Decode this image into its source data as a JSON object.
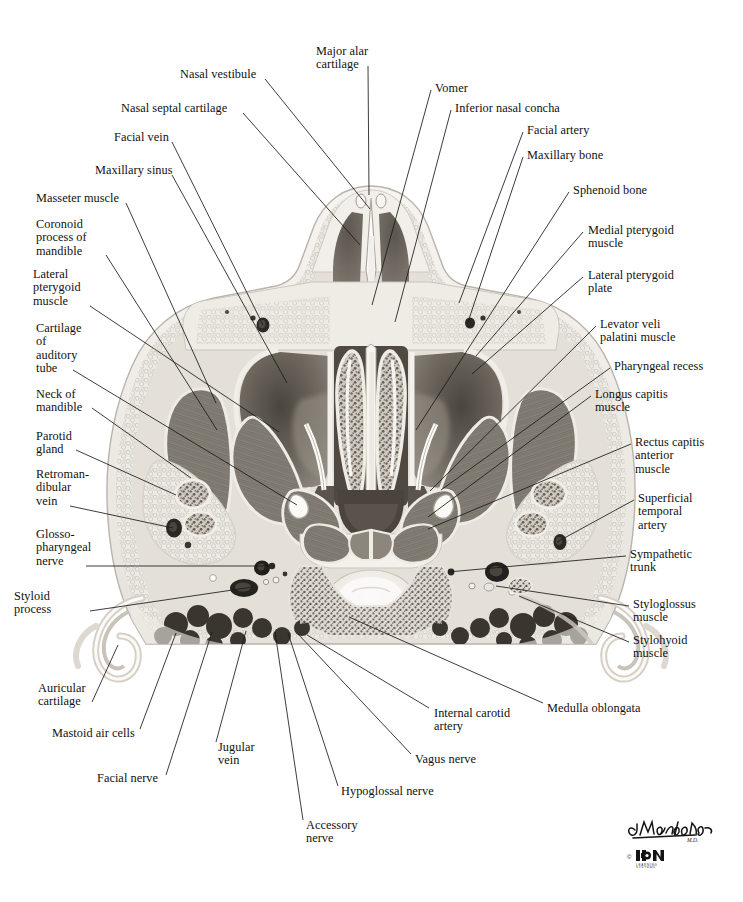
{
  "figure": {
    "type": "anatomical-illustration",
    "modality": "grayscale medical illustration",
    "credit_signature": "C. Machado",
    "credit_suffix": "M.D.",
    "copyright_symbol": "©",
    "publisher_logo_text": "ICON",
    "publisher_logo_sub": "LEARNING SYSTEMS"
  },
  "palette": {
    "background": "#ffffff",
    "line": "#1a1a1a",
    "text": "#111111",
    "tissue_light": "#efece6",
    "tissue_mid": "#c8c3ba",
    "muscle": "#8a857c",
    "muscle_dark": "#6b665e",
    "airspace": "#555049",
    "airspace_deep": "#3d3832",
    "bone_white": "#f7f5f1",
    "vessel_dark": "#2b2723",
    "mucosa": "#9a948a"
  },
  "labels_left": [
    {
      "id": "nasal-vestibule",
      "text": "Nasal vestibule",
      "x": 180,
      "y": 68,
      "anchor_x": 265,
      "anchor_y": 79,
      "target_x": 370,
      "target_y": 209
    },
    {
      "id": "nasal-septal-cartilage",
      "text": "Nasal septal cartilage",
      "x": 121,
      "y": 102,
      "anchor_x": 243,
      "anchor_y": 113,
      "target_x": 360,
      "target_y": 245
    },
    {
      "id": "facial-vein",
      "text": "Facial vein",
      "x": 114,
      "y": 131,
      "anchor_x": 172,
      "anchor_y": 142,
      "target_x": 263,
      "target_y": 325
    },
    {
      "id": "maxillary-sinus",
      "text": "Maxillary sinus",
      "x": 95,
      "y": 164,
      "anchor_x": 172,
      "anchor_y": 175,
      "target_x": 287,
      "target_y": 383
    },
    {
      "id": "masseter-muscle",
      "text": "Masseter muscle",
      "x": 36,
      "y": 192,
      "anchor_x": 126,
      "anchor_y": 203,
      "target_x": 216,
      "target_y": 403
    },
    {
      "id": "coronoid-process-of-mandible",
      "text": "Coronoid\nprocess of\nmandible",
      "x": 36,
      "y": 218,
      "anchor_x": 106,
      "anchor_y": 255,
      "target_x": 217,
      "target_y": 430
    },
    {
      "id": "lateral-pterygoid-muscle",
      "text": "Lateral\npterygoid\nmuscle",
      "x": 33,
      "y": 268,
      "anchor_x": 90,
      "anchor_y": 306,
      "target_x": 279,
      "target_y": 432
    },
    {
      "id": "cartilage-of-auditory-tube",
      "text": "Cartilage\nof\nauditory\ntube",
      "x": 36,
      "y": 322,
      "anchor_x": 73,
      "anchor_y": 370,
      "target_x": 297,
      "target_y": 505
    },
    {
      "id": "neck-of-mandible",
      "text": "Neck of\nmandible",
      "x": 36,
      "y": 388,
      "anchor_x": 92,
      "anchor_y": 408,
      "target_x": 191,
      "target_y": 478
    },
    {
      "id": "parotid-gland",
      "text": "Parotid\ngland",
      "x": 36,
      "y": 430,
      "anchor_x": 76,
      "anchor_y": 450,
      "target_x": 176,
      "target_y": 495
    },
    {
      "id": "retromandibular-vein",
      "text": "Retroman-\ndibular\nvein",
      "x": 36,
      "y": 468,
      "anchor_x": 70,
      "anchor_y": 506,
      "target_x": 173,
      "target_y": 528
    },
    {
      "id": "glossopharyngeal-nerve",
      "text": "Glosso-\npharyngeal\nnerve",
      "x": 36,
      "y": 528,
      "anchor_x": 86,
      "anchor_y": 566,
      "target_x": 270,
      "target_y": 566
    },
    {
      "id": "styloid-process",
      "text": "Styloid\nprocess",
      "x": 14,
      "y": 590,
      "anchor_x": 90,
      "anchor_y": 611,
      "target_x": 253,
      "target_y": 587
    }
  ],
  "labels_bottom_left": [
    {
      "id": "auricular-cartilage",
      "text": "Auricular\ncartilage",
      "x": 38,
      "y": 682,
      "anchor_x": 92,
      "anchor_y": 702,
      "target_x": 118,
      "target_y": 645
    },
    {
      "id": "mastoid-air-cells",
      "text": "Mastoid air cells",
      "x": 52,
      "y": 727,
      "anchor_x": 140,
      "anchor_y": 729,
      "target_x": 176,
      "target_y": 633
    },
    {
      "id": "facial-nerve",
      "text": "Facial nerve",
      "x": 97,
      "y": 772,
      "anchor_x": 166,
      "anchor_y": 775,
      "target_x": 212,
      "target_y": 632
    },
    {
      "id": "jugular-vein",
      "text": "Jugular\nvein",
      "x": 218,
      "y": 741,
      "anchor_x": 216,
      "anchor_y": 742,
      "target_x": 246,
      "target_y": 631
    },
    {
      "id": "accessory-nerve",
      "text": "Accessory\nnerve",
      "x": 306,
      "y": 819,
      "anchor_x": 303,
      "anchor_y": 820,
      "target_x": 275,
      "target_y": 632
    },
    {
      "id": "hypoglossal-nerve",
      "text": "Hypoglossal nerve",
      "x": 341,
      "y": 785,
      "anchor_x": 338,
      "anchor_y": 786,
      "target_x": 288,
      "target_y": 633
    },
    {
      "id": "vagus-nerve",
      "text": "Vagus nerve",
      "x": 415,
      "y": 753,
      "anchor_x": 411,
      "anchor_y": 754,
      "target_x": 298,
      "target_y": 634
    },
    {
      "id": "internal-carotid-artery",
      "text": "Internal carotid\nartery",
      "x": 434,
      "y": 707,
      "anchor_x": 429,
      "anchor_y": 708,
      "target_x": 307,
      "target_y": 635
    },
    {
      "id": "medulla-oblongata",
      "text": "Medulla oblongata",
      "x": 547,
      "y": 702,
      "anchor_x": 543,
      "anchor_y": 703,
      "target_x": 349,
      "target_y": 617
    }
  ],
  "labels_right": [
    {
      "id": "major-alar-cartilage",
      "text": "Major alar\ncartilage",
      "x": 316,
      "y": 45,
      "anchor_x": 368,
      "anchor_y": 66,
      "target_x": 369,
      "target_y": 195
    },
    {
      "id": "vomer",
      "text": "Vomer",
      "x": 435,
      "y": 82,
      "anchor_x": 431,
      "anchor_y": 90,
      "target_x": 372,
      "target_y": 305
    },
    {
      "id": "inferior-nasal-concha",
      "text": "Inferior nasal concha",
      "x": 455,
      "y": 102,
      "anchor_x": 451,
      "anchor_y": 110,
      "target_x": 395,
      "target_y": 322
    },
    {
      "id": "facial-artery",
      "text": "Facial artery",
      "x": 527,
      "y": 124,
      "anchor_x": 523,
      "anchor_y": 132,
      "target_x": 459,
      "target_y": 303
    },
    {
      "id": "maxillary-bone",
      "text": "Maxillary bone",
      "x": 527,
      "y": 149,
      "anchor_x": 523,
      "anchor_y": 157,
      "target_x": 468,
      "target_y": 322
    },
    {
      "id": "sphenoid-bone",
      "text": "Sphenoid bone",
      "x": 573,
      "y": 184,
      "anchor_x": 569,
      "anchor_y": 192,
      "target_x": 416,
      "target_y": 430
    },
    {
      "id": "medial-pterygoid-muscle",
      "text": "Medial pterygoid\nmuscle",
      "x": 588,
      "y": 224,
      "anchor_x": 583,
      "anchor_y": 232,
      "target_x": 476,
      "target_y": 356
    },
    {
      "id": "lateral-pterygoid-plate",
      "text": "Lateral pterygoid\nplate",
      "x": 588,
      "y": 269,
      "anchor_x": 583,
      "anchor_y": 277,
      "target_x": 472,
      "target_y": 374
    },
    {
      "id": "levator-veli-palatini-muscle",
      "text": "Levator veli\npalatini muscle",
      "x": 600,
      "y": 318,
      "anchor_x": 596,
      "anchor_y": 326,
      "target_x": 430,
      "target_y": 491
    },
    {
      "id": "pharyngeal-recess",
      "text": "Pharyngeal recess",
      "x": 614,
      "y": 360,
      "anchor_x": 610,
      "anchor_y": 368,
      "target_x": 441,
      "target_y": 490
    },
    {
      "id": "longus-capitis-muscle",
      "text": "Longus capitis\nmuscle",
      "x": 595,
      "y": 388,
      "anchor_x": 591,
      "anchor_y": 396,
      "target_x": 428,
      "target_y": 517
    },
    {
      "id": "rectus-capitis-anterior-muscle",
      "text": "Rectus capitis\nanterior\nmuscle",
      "x": 635,
      "y": 436,
      "anchor_x": 631,
      "anchor_y": 444,
      "target_x": 428,
      "target_y": 529
    },
    {
      "id": "superficial-temporal-artery",
      "text": "Superficial\ntemporal\nartery",
      "x": 638,
      "y": 492,
      "anchor_x": 634,
      "anchor_y": 500,
      "target_x": 557,
      "target_y": 542
    },
    {
      "id": "sympathetic-trunk",
      "text": "Sympathetic\ntrunk",
      "x": 630,
      "y": 548,
      "anchor_x": 626,
      "anchor_y": 556,
      "target_x": 448,
      "target_y": 572
    },
    {
      "id": "styloglossus-muscle",
      "text": "Styloglossus\nmuscle",
      "x": 633,
      "y": 598,
      "anchor_x": 629,
      "anchor_y": 606,
      "target_x": 496,
      "target_y": 586
    },
    {
      "id": "stylohyoid-muscle",
      "text": "Stylohyoid\nmuscle",
      "x": 633,
      "y": 634,
      "anchor_x": 629,
      "anchor_y": 642,
      "target_x": 519,
      "target_y": 596
    }
  ]
}
